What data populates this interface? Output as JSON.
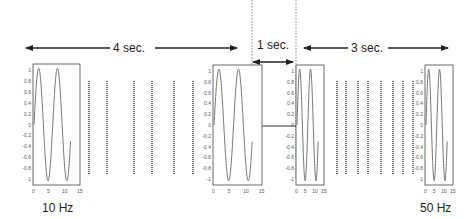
{
  "diagram": {
    "title": "",
    "durations": {
      "first": "4 sec.",
      "gap": "1 sec.",
      "second": "3 sec."
    },
    "frequency_labels": {
      "start": "10 Hz",
      "end": "50 Hz"
    },
    "plots": [
      {
        "id": "plot-1",
        "x": 33,
        "y": 64,
        "w": 47,
        "h": 121,
        "cycles": 2.0,
        "xticks": [
          "0",
          "5",
          "10",
          "15"
        ],
        "yticks": [
          "1",
          "0.8",
          "0.6",
          "0.4",
          "0.2",
          "0",
          "-0.2",
          "-0.4",
          "-0.6",
          "-0.8",
          "-1"
        ]
      },
      {
        "id": "plot-2",
        "x": 213,
        "y": 65,
        "w": 49,
        "h": 120,
        "cycles": 2.0,
        "xticks": [
          "0",
          "5",
          "10",
          "15"
        ],
        "yticks": [
          "1",
          "0.8",
          "0.6",
          "0.4",
          "0.2",
          "0",
          "-0.2",
          "-0.4",
          "-0.6",
          "-0.8",
          "-1"
        ]
      },
      {
        "id": "plot-3",
        "x": 296,
        "y": 65,
        "w": 28,
        "h": 120,
        "cycles": 2.0,
        "xticks": [
          "0",
          "5",
          "10",
          "15"
        ],
        "yticks": [
          "1",
          "0.8",
          "0.6",
          "0.4",
          "0.2",
          "0",
          "-0.2",
          "-0.4",
          "-0.6",
          "-0.8",
          "-1"
        ]
      },
      {
        "id": "plot-4",
        "x": 425,
        "y": 65,
        "w": 28,
        "h": 120,
        "cycles": 2.0,
        "xticks": [
          "0",
          "5",
          "10",
          "15"
        ],
        "yticks": [
          "1",
          "0.8",
          "0.6",
          "0.4",
          "0.2",
          "0",
          "-0.2",
          "-0.4",
          "-0.6",
          "-0.8",
          "-1"
        ]
      }
    ],
    "dotted_groups": [
      {
        "xs": [
          89,
          107,
          134,
          152,
          174,
          193
        ],
        "y1": 81,
        "y2": 175
      },
      {
        "xs": [
          337,
          346,
          358,
          368,
          381,
          393,
          403,
          413
        ],
        "y1": 81,
        "y2": 175
      }
    ],
    "colors": {
      "line": "#222222",
      "wave": "#666666",
      "box": "#444444",
      "dotted": "#333333"
    }
  }
}
